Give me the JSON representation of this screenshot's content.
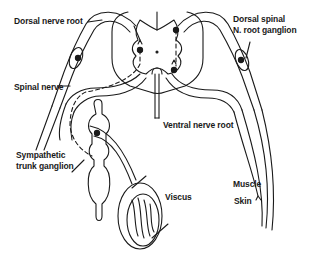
{
  "diagram": {
    "colors": {
      "line": "#1a1a1a",
      "background": "#ffffff"
    },
    "labels": {
      "dorsal_nerve_root": "Dorsal nerve root",
      "dorsal_spinal_ganglion_line1": "Dorsal spinal",
      "dorsal_spinal_ganglion_line2": "N. root ganglion",
      "spinal_nerve": "Spinal nerve",
      "ventral_nerve_root": "Ventral nerve  root",
      "sympathetic_line1": "Sympathetic",
      "sympathetic_line2": "trunk ganglion",
      "viscus": "Viscus",
      "muscle": "Muscle",
      "skin": "Skin"
    }
  }
}
